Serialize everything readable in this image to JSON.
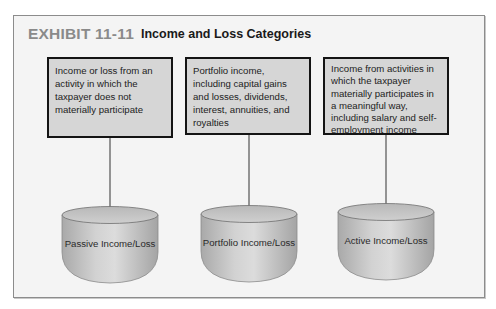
{
  "exhibit": {
    "label": "EXHIBIT 11-11",
    "title": "Income and Loss Categories"
  },
  "categories": [
    {
      "description": "Income or loss from an activity in which the taxpayer does not materially participate",
      "description_lines": [
        "Income or loss from an",
        "activity in which the",
        "taxpayer does not materially",
        "participate"
      ],
      "cylinder_label": "Passive Income/Loss"
    },
    {
      "description": "Portfolio income, including capital gains and losses, dividends, interest, annuities, and royalties",
      "description_lines": [
        "Portfolio income, including",
        "capital gains and losses,",
        "dividends, interest,",
        "annuities, and royalties"
      ],
      "cylinder_label": "Portfolio Income/Loss"
    },
    {
      "description": "Income from activities in which the taxpayer materially participates in a meaningful way, including salary and self-employment income",
      "description_lines": [
        "Income from activities in",
        "which the taxpayer",
        "materially participates in a",
        "meaningful way, including",
        "salary and self-employment",
        "income"
      ],
      "cylinder_label": "Active Income/Loss"
    }
  ],
  "colors": {
    "panel_bg": "#f4f4f4",
    "box_fill": "#d6d6d6",
    "box_border": "#141414",
    "exhibit_label": "#8a8a8a",
    "cylinder_fill": "#c4c4c4"
  }
}
